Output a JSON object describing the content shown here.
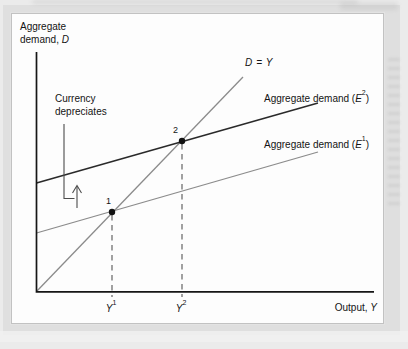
{
  "colors": {
    "page_bg": "#ebebeb",
    "mat_bg": "#dfdfdf",
    "panel_bg": "#fdfdfd",
    "panel_border": "#c2c2c2",
    "text": "#141414",
    "axis": "#161616",
    "line_d_equals_y": "#8b8b8b",
    "line_ad2": "#2a2a2a",
    "line_ad1": "#8b8b8b",
    "dashed": "#565656",
    "annotation": "#4c4c4c",
    "point_fill": "#111111"
  },
  "labels": {
    "y_axis_line1": "Aggregate",
    "y_axis_line2_prefix": "demand, ",
    "y_axis_line2_var": "D",
    "x_axis_prefix": "Output, ",
    "x_axis_var": "Y",
    "d_equals_y": "D = Y",
    "ad_prefix": "Aggregate demand (",
    "ad_var": "E",
    "ad2_sup": "2",
    "ad1_sup": "1",
    "ad_suffix": ")",
    "currency_line1": "Currency",
    "currency_line2": "depreciates",
    "point1": "1",
    "point2": "2",
    "y1_var": "Y",
    "y1_sup": "1",
    "y2_var": "Y",
    "y2_sup": "2"
  },
  "geometry": {
    "axes": {
      "x": 36.5,
      "y_top": 52,
      "y_bottom": 291.8,
      "x_right": 374
    },
    "curves": [
      {
        "name": "line-d-equals-y",
        "from": [
          36.5,
          291.5
        ],
        "to": [
          243,
          77
        ],
        "color": "line_d_equals_y",
        "width": 1.3
      },
      {
        "name": "line-aggregate-demand-e2",
        "from": [
          36.5,
          183
        ],
        "to": [
          318,
          103
        ],
        "color": "line_ad2",
        "width": 1.6
      },
      {
        "name": "line-aggregate-demand-e1",
        "from": [
          36.5,
          233
        ],
        "to": [
          318,
          152
        ],
        "color": "line_ad1",
        "width": 1.3
      }
    ],
    "dashes": [
      {
        "name": "dashed-dropline-y1",
        "x": 112,
        "y1": 215,
        "y2": 297
      },
      {
        "name": "dashed-dropline-y2",
        "x": 182,
        "y1": 144,
        "y2": 297
      }
    ],
    "points": [
      {
        "name": "equilibrium-point-1",
        "x": 112,
        "y": 212,
        "r": 3.2
      },
      {
        "name": "equilibrium-point-2",
        "x": 182,
        "y": 141,
        "r": 3.2
      }
    ],
    "leader": [
      [
        64,
        124
      ],
      [
        64,
        198.5
      ],
      [
        74.5,
        198.5
      ]
    ],
    "arrow_shaft": [
      [
        77,
        208
      ],
      [
        77,
        186
      ]
    ],
    "arrow_head": [
      [
        72.5,
        193
      ],
      [
        77,
        185.5
      ],
      [
        81.5,
        193
      ]
    ]
  },
  "chart_data": {
    "type": "line",
    "title": "",
    "xlabel": "Output, Y",
    "ylabel": "Aggregate demand, D",
    "grid": false,
    "x_tick_labels": [
      "Y¹",
      "Y²"
    ],
    "series": [
      {
        "name": "D = Y",
        "style": "45-degree reference line through the origin"
      },
      {
        "name": "Aggregate demand (E²)",
        "style": "dark schedule, shifted up after currency depreciation"
      },
      {
        "name": "Aggregate demand (E¹)",
        "style": "gray initial aggregate demand schedule"
      }
    ],
    "points": [
      {
        "label": "1",
        "x": "Y¹",
        "description": "equilibrium where Aggregate demand (E¹) crosses D = Y"
      },
      {
        "label": "2",
        "x": "Y²",
        "description": "equilibrium where Aggregate demand (E²) crosses D = Y"
      }
    ],
    "annotations": [
      "Currency depreciates",
      "upward arrow indicating shift from E¹ schedule to E² schedule"
    ]
  }
}
